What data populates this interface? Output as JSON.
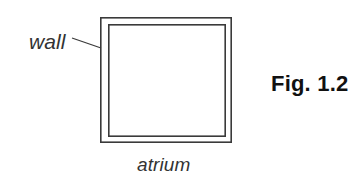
{
  "figure": {
    "number_label": "Fig. 1.2",
    "canvas": {
      "width": 361,
      "height": 179,
      "background_color": "#ffffff"
    },
    "stroke_color": "#3a3a3a",
    "text_color": "#333333",
    "figure_number_color": "#111111"
  },
  "diagram": {
    "type": "plan-view-square-enclosure",
    "outer_square": {
      "x": 100,
      "y": 17,
      "width": 132,
      "height": 126
    },
    "inner_square": {
      "x": 108,
      "y": 24,
      "width": 118,
      "height": 113
    },
    "wall_thickness_px": 7
  },
  "labels": {
    "wall": "wall",
    "atrium": "atrium"
  },
  "leader_line": {
    "x1": 72,
    "y1": 38,
    "x2": 101,
    "y2": 48
  }
}
